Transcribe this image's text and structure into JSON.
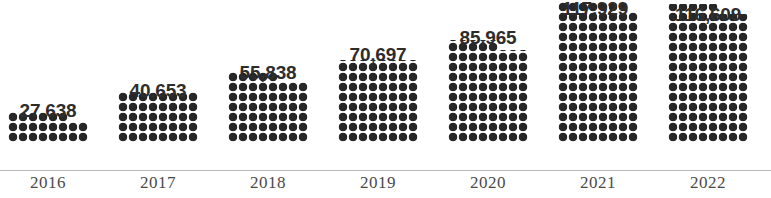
{
  "chart_data": {
    "type": "bar",
    "title": "",
    "subtitle": "",
    "xlabel": "",
    "ylabel": "",
    "grid": false,
    "legend": null,
    "axis_baseline_color": "#b9b9b9",
    "bar_fill_color": "#272727",
    "label_color": "#2d2d2d",
    "year_label_color": "#4a4a4a",
    "background_color": "#ffffff",
    "ylim": [
      0,
      125000
    ],
    "categories": [
      "2016",
      "2017",
      "2018",
      "2019",
      "2020",
      "2021",
      "2022"
    ],
    "values": [
      27638,
      40653,
      55838,
      70697,
      85965,
      117929,
      116609
    ],
    "value_labels": [
      "27,638",
      "40.653",
      "55,838",
      "70,697",
      "85,965",
      "117,929",
      "116,609"
    ],
    "series": [
      {
        "name": "",
        "values": [
          27638,
          40653,
          55838,
          70697,
          85965,
          117929,
          116609
        ]
      }
    ]
  },
  "bars": [
    {
      "year": "2016",
      "value_label": "27,638",
      "left": 8,
      "width": 80,
      "height": 30,
      "step_width": 20,
      "step_height": 10,
      "label_left": 2,
      "label_top": 100
    },
    {
      "year": "2017",
      "value_label": "40.653",
      "left": 118,
      "width": 80,
      "height": 50,
      "step_width": 0,
      "step_height": 0,
      "label_left": 112,
      "label_top": 80
    },
    {
      "year": "2018",
      "value_label": "55,838",
      "left": 228,
      "width": 80,
      "height": 70,
      "step_width": 30,
      "step_height": 10,
      "label_left": 222,
      "label_top": 62
    },
    {
      "year": "2019",
      "value_label": "70,697",
      "left": 338,
      "width": 80,
      "height": 82,
      "step_width": 0,
      "step_height": 0,
      "label_left": 332,
      "label_top": 44
    },
    {
      "year": "2020",
      "value_label": "85,965",
      "left": 448,
      "width": 80,
      "height": 102,
      "step_width": 30,
      "step_height": 10,
      "label_left": 442,
      "label_top": 27
    },
    {
      "year": "2021",
      "value_label": "117,929",
      "left": 558,
      "width": 80,
      "height": 140,
      "step_width": 10,
      "step_height": 10,
      "label_left": 549,
      "label_top": -2
    },
    {
      "year": "2022",
      "value_label": "116,609",
      "left": 668,
      "width": 80,
      "height": 138,
      "step_width": 30,
      "step_height": 10,
      "label_left": 662,
      "label_top": 4
    }
  ]
}
